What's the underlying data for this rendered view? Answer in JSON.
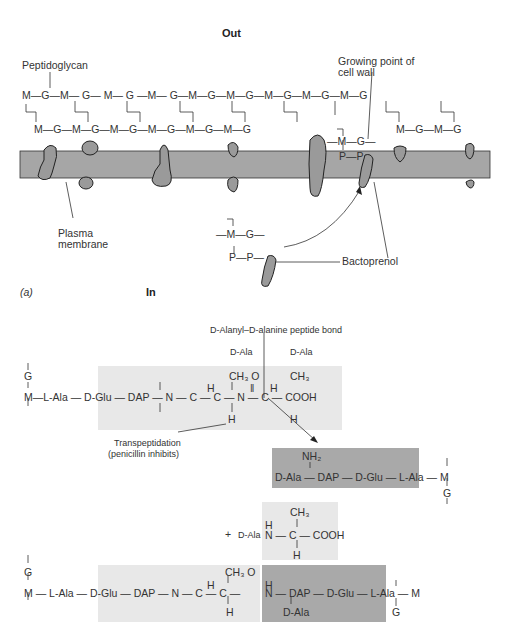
{
  "panel_a": {
    "label_out": "Out",
    "label_in": "In",
    "panel_label": "(a)",
    "label_peptidoglycan": "Peptidoglycan",
    "label_growing_point_1": "Growing point of",
    "label_growing_point_2": "cell wall",
    "label_plasma_1": "Plasma",
    "label_plasma_2": "membrane",
    "label_bactoprenol": "Bactoprenol",
    "top_strand": [
      "M",
      "G",
      "M",
      "G",
      "M",
      "G",
      "M",
      "G",
      "M",
      "G",
      "M",
      "G",
      "M",
      "G",
      "M",
      "G",
      "M",
      "G"
    ],
    "bottom_strand_left": [
      "M",
      "G",
      "M",
      "G",
      "M",
      "G",
      "M",
      "G",
      "M",
      "G",
      "M",
      "G"
    ],
    "bottom_strand_right": [
      "M",
      "G",
      "M",
      "G"
    ],
    "growing_unit": {
      "m": "M",
      "g": "G",
      "p1": "P",
      "p2": "P"
    },
    "free_unit": {
      "m": "M",
      "g": "G",
      "p1": "P",
      "p2": "P"
    }
  },
  "panel_b": {
    "label_bond": "D-Alanyl–D-alanine peptide bond",
    "label_dala_1": "D-Ala",
    "label_dala_2": "D-Ala",
    "label_transpeptidation_1": "Transpeptidation",
    "label_transpeptidation_2": "(penicillin inhibits)",
    "strand1": {
      "g": "G",
      "m": "M",
      "chain": "—L-Ala — D-Glu — DAP — N — C — C — N — C — COOH",
      "h1": "H",
      "ch3_o": "CH₃ O",
      "dbl": "‖",
      "h2": "H",
      "ch3_2": "CH₃",
      "h_bottom1": "H",
      "h_bottom2": "H"
    },
    "strand2": {
      "nh2": "NH₂",
      "chain": "D-Ala — DAP — D-Glu — L-Ala — M",
      "g": "G"
    },
    "released": {
      "plus": "+",
      "dala": "D-Ala",
      "ch3": "CH₃",
      "h_top": "H",
      "chain": "N — C — COOH",
      "h_bottom": "H"
    },
    "product": {
      "g": "G",
      "m": "M",
      "chain_left": "M — L-Ala — D-Glu — DAP — N — C — C —",
      "chain_right": "N — DAP — D-Glu — L-Ala — M",
      "ch3_o": "CH₃ O",
      "h1": "H",
      "h_bottom": "H",
      "h2": "H",
      "dala": "D-Ala",
      "g_right": "G"
    }
  },
  "colors": {
    "membrane": "#a6a6a6",
    "protein": "#9a9a9a",
    "light_box": "#e8e8e8",
    "dark_box": "#a9a9a9",
    "text": "#333333"
  }
}
